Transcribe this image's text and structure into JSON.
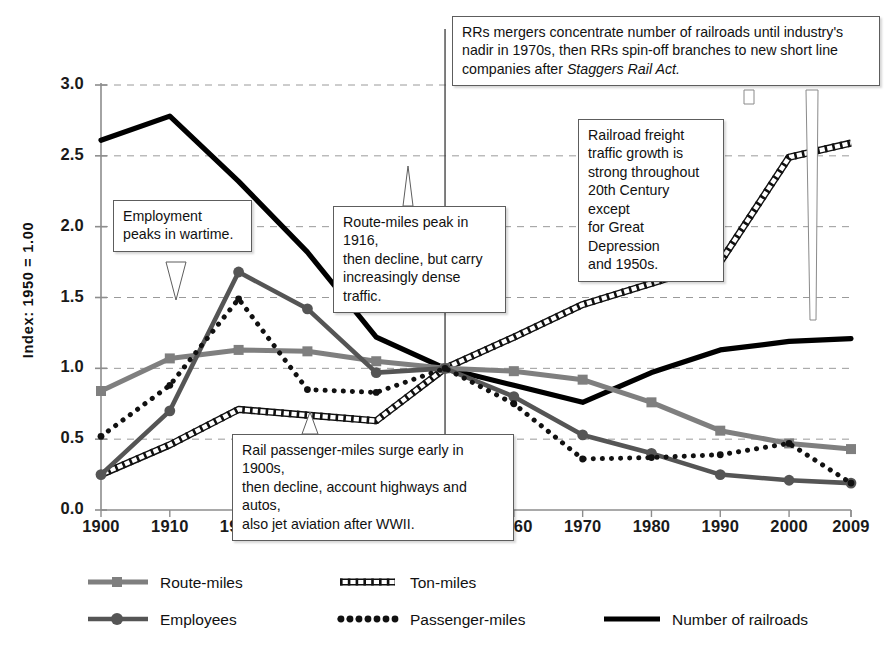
{
  "chart_data": {
    "type": "line",
    "title": "",
    "xlabel": "",
    "ylabel": "Index: 1950 = 1.00",
    "x": [
      1900,
      1910,
      1920,
      1930,
      1940,
      1950,
      1960,
      1970,
      1980,
      1990,
      2000,
      2009
    ],
    "xticklabels": [
      "1900",
      "1910",
      "1920",
      "1930",
      "1940",
      "1950",
      "1960",
      "1970",
      "1980",
      "1990",
      "2000",
      "2009"
    ],
    "yticklabels": [
      "0.0",
      "0.5",
      "1.0",
      "1.5",
      "2.0",
      "2.5",
      "3.0"
    ],
    "ytickvalues": [
      0.0,
      0.5,
      1.0,
      1.5,
      2.0,
      2.5,
      3.0
    ],
    "ylim": [
      0.0,
      3.0
    ],
    "xlim": [
      1900,
      2009
    ],
    "grid": "horizontal-dashed",
    "legend_position": "bottom",
    "reference_line_x": 1950,
    "series": [
      {
        "name": "Route-miles",
        "color": "#7f7f7f",
        "style": "solid-thick-square-markers",
        "values": [
          0.84,
          1.07,
          1.13,
          1.12,
          1.05,
          1.0,
          0.98,
          0.92,
          0.76,
          0.56,
          0.47,
          0.43
        ]
      },
      {
        "name": "Employees",
        "color": "#555555",
        "style": "solid-thick-circle-markers",
        "values": [
          0.25,
          0.7,
          1.68,
          1.42,
          0.97,
          1.0,
          0.8,
          0.53,
          0.4,
          0.25,
          0.21,
          0.19
        ]
      },
      {
        "name": "Ton-miles",
        "color": "#111111",
        "style": "hatched-ladder",
        "values": [
          0.25,
          0.46,
          0.71,
          0.67,
          0.63,
          1.0,
          1.22,
          1.45,
          1.6,
          1.75,
          2.49,
          2.59
        ]
      },
      {
        "name": "Passenger-miles",
        "color": "#111111",
        "style": "dotted-round",
        "values": [
          0.52,
          0.88,
          1.49,
          0.85,
          0.83,
          1.0,
          0.75,
          0.36,
          0.37,
          0.39,
          0.47,
          0.19
        ]
      },
      {
        "name": "Number of railroads",
        "color": "#000000",
        "style": "solid-heavy",
        "values": [
          2.61,
          2.78,
          2.32,
          1.82,
          1.22,
          1.0,
          0.88,
          0.76,
          0.97,
          1.13,
          1.19,
          1.21
        ]
      }
    ]
  },
  "annotations": [
    {
      "id": "railroads-note",
      "text_lines": [
        "RRs mergers concentrate number of railroads until industry's",
        "nadir in 1970s, then RRs spin-off branches to new short line",
        "companies after "
      ],
      "italic_tail": "Staggers Rail Act.",
      "target": "Number of railroads"
    },
    {
      "id": "freight-note",
      "text_lines": [
        "Railroad freight",
        "traffic growth is",
        "strong throughout",
        "20th Century except",
        "for Great Depression",
        "and 1950s."
      ],
      "target": "Ton-miles"
    },
    {
      "id": "employment-note",
      "text_lines": [
        "Employment",
        "peaks in wartime."
      ],
      "target": "Employees"
    },
    {
      "id": "route-miles-note",
      "text_lines": [
        "Route-miles peak in 1916,",
        "then decline, but carry",
        "increasingly dense traffic."
      ],
      "target": "Route-miles"
    },
    {
      "id": "passenger-note",
      "text_lines": [
        "Rail passenger-miles surge early in 1900s,",
        "then decline, account highways and autos,",
        "also jet aviation after WWII."
      ],
      "target": "Passenger-miles"
    }
  ],
  "legend": {
    "items": [
      {
        "label": "Route-miles",
        "swatch": "route-miles-swatch"
      },
      {
        "label": "Ton-miles",
        "swatch": "ton-miles-swatch"
      },
      {
        "label": "Employees",
        "swatch": "employees-swatch"
      },
      {
        "label": "Passenger-miles",
        "swatch": "passenger-miles-swatch"
      },
      {
        "label": "Number of railroads",
        "swatch": "number-of-railroads-swatch"
      }
    ]
  },
  "colors": {
    "grid": "#9a9a9a",
    "axis": "#8d8d8d",
    "background": "#ffffff",
    "route_miles": "#7f7f7f",
    "employees": "#555555",
    "ton_miles": "#111111",
    "passenger_miles": "#111111",
    "railroads": "#000000"
  }
}
